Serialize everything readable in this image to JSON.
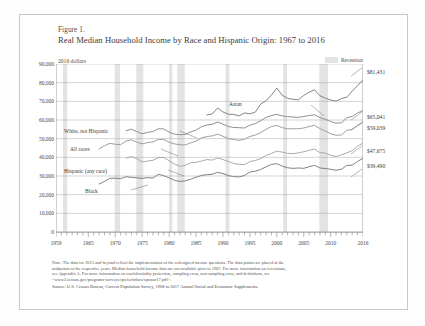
{
  "figure": {
    "label": "Figure 1.",
    "title": "Real Median Household Income by Race and Hispanic Origin: 1967 to 2016",
    "units_label": "2016 dollars"
  },
  "legend": {
    "recession_label": "Recession",
    "recession_color": "#e3e3e3"
  },
  "axes": {
    "y_ticks": [
      "0",
      "10,000",
      "20,000",
      "30,000",
      "40,000",
      "50,000",
      "60,000",
      "70,000",
      "80,000",
      "90,000"
    ],
    "x_ticks": [
      "1959",
      "1965",
      "1970",
      "1975",
      "1980",
      "1985",
      "1990",
      "1995",
      "2000",
      "2005",
      "2010",
      "2016"
    ]
  },
  "series_labels": {
    "asian": "Asian",
    "white_not_hispanic": "White, not Hispanic",
    "all_races": "All races",
    "hispanic": "Hispanic (any race)",
    "black": "Black"
  },
  "end_values": {
    "asian": "$81,431",
    "white_not_hispanic": "$65,041",
    "all_races": "$59,039",
    "hispanic": "$47,675",
    "black": "$39,490"
  },
  "notes": {
    "line1": "Note: The data for 2013 and beyond reflect the implementation of the redesigned income questions. The data points are placed at the",
    "line2": "midpoints of the respective years. Median household income data are not available prior to 1967. For more information on recessions,",
    "line3": "see Appendix A. For more information on confidentiality protection, sampling error, non-sampling error, and definitions, see",
    "line4": "<www2.census.gov/programs-surveys/cps/techdocs/cpsmar17.pdf>.",
    "source": "Source: U.S. Census Bureau, Current Population Survey, 1968 to 2017 Annual Social and Economic Supplements."
  },
  "chart_data": {
    "type": "line",
    "title": "Real Median Household Income by Race and Hispanic Origin: 1967 to 2016",
    "xlabel": "",
    "ylabel": "2016 dollars",
    "xlim": [
      1959,
      2016
    ],
    "ylim": [
      0,
      90000
    ],
    "grid": true,
    "legend_position": "inline-annotations",
    "recession_bands": [
      [
        1960.3,
        1961.1
      ],
      [
        1969.9,
        1970.9
      ],
      [
        1973.9,
        1975.2
      ],
      [
        1980.0,
        1980.6
      ],
      [
        1981.5,
        1982.9
      ],
      [
        1990.5,
        1991.2
      ],
      [
        2001.2,
        2001.9
      ],
      [
        2007.9,
        2009.5
      ]
    ],
    "series": [
      {
        "name": "Asian",
        "color": "#7d7d7d",
        "x": [
          1987,
          1988,
          1989,
          1990,
          1991,
          1992,
          1993,
          1994,
          1995,
          1996,
          1997,
          1998,
          1999,
          2000,
          2001,
          2002,
          2003,
          2004,
          2005,
          2006,
          2007,
          2008,
          2009,
          2010,
          2011,
          2012,
          2013,
          2014,
          2015,
          2016
        ],
        "values": [
          62700,
          63200,
          66500,
          64300,
          63100,
          63000,
          62200,
          63800,
          63300,
          64200,
          68600,
          70300,
          73400,
          77100,
          73300,
          71600,
          71100,
          70800,
          73200,
          74900,
          76200,
          73000,
          71700,
          70700,
          70100,
          71500,
          72200,
          75500,
          78400,
          81431
        ]
      },
      {
        "name": "White, not Hispanic",
        "color": "#8a8a8a",
        "x": [
          1972,
          1973,
          1974,
          1975,
          1976,
          1977,
          1978,
          1979,
          1980,
          1981,
          1982,
          1983,
          1984,
          1985,
          1986,
          1987,
          1988,
          1989,
          1990,
          1991,
          1992,
          1993,
          1994,
          1995,
          1996,
          1997,
          1998,
          1999,
          2000,
          2001,
          2002,
          2003,
          2004,
          2005,
          2006,
          2007,
          2008,
          2009,
          2010,
          2011,
          2012,
          2013,
          2014,
          2015,
          2016
        ],
        "values": [
          54200,
          55100,
          53800,
          52600,
          53400,
          53800,
          55300,
          55200,
          53500,
          52400,
          52100,
          52300,
          53600,
          54600,
          56400,
          57300,
          57700,
          58900,
          57800,
          56500,
          56000,
          55900,
          55700,
          57200,
          58100,
          59600,
          61400,
          62400,
          63000,
          62200,
          61800,
          61600,
          61400,
          61900,
          62400,
          62800,
          61300,
          60400,
          59200,
          58300,
          58500,
          61200,
          61900,
          63800,
          65041
        ]
      },
      {
        "name": "All races",
        "color": "#9a9a9a",
        "x": [
          1967,
          1968,
          1969,
          1970,
          1971,
          1972,
          1973,
          1974,
          1975,
          1976,
          1977,
          1978,
          1979,
          1980,
          1981,
          1982,
          1983,
          1984,
          1985,
          1986,
          1987,
          1988,
          1989,
          1990,
          1991,
          1992,
          1993,
          1994,
          1995,
          1996,
          1997,
          1998,
          1999,
          2000,
          2001,
          2002,
          2003,
          2004,
          2005,
          2006,
          2007,
          2008,
          2009,
          2010,
          2011,
          2012,
          2013,
          2014,
          2015,
          2016
        ],
        "values": [
          44500,
          46200,
          47500,
          47000,
          46800,
          48700,
          49400,
          48200,
          47200,
          47900,
          48200,
          49600,
          49600,
          48100,
          47200,
          46700,
          46700,
          47700,
          48700,
          50400,
          51100,
          51500,
          52400,
          51300,
          50000,
          49600,
          49100,
          49700,
          51200,
          51900,
          53200,
          55000,
          56500,
          57100,
          55900,
          55300,
          55300,
          55300,
          55700,
          56500,
          57100,
          55400,
          54100,
          52600,
          51800,
          52000,
          54500,
          54900,
          57200,
          59039
        ]
      },
      {
        "name": "Hispanic (any race)",
        "color": "#a5a5a5",
        "x": [
          1972,
          1973,
          1974,
          1975,
          1976,
          1977,
          1978,
          1979,
          1980,
          1981,
          1982,
          1983,
          1984,
          1985,
          1986,
          1987,
          1988,
          1989,
          1990,
          1991,
          1992,
          1993,
          1994,
          1995,
          1996,
          1997,
          1998,
          1999,
          2000,
          2001,
          2002,
          2003,
          2004,
          2005,
          2006,
          2007,
          2008,
          2009,
          2010,
          2011,
          2012,
          2013,
          2014,
          2015,
          2016
        ],
        "values": [
          39600,
          40400,
          39300,
          37600,
          38000,
          38400,
          39900,
          39900,
          38200,
          36400,
          35200,
          35700,
          37100,
          37300,
          38000,
          38800,
          38500,
          39700,
          38800,
          37800,
          36700,
          36300,
          36100,
          37700,
          38300,
          39300,
          41000,
          42100,
          43300,
          42800,
          42100,
          42000,
          42400,
          43000,
          43700,
          44500,
          42500,
          42300,
          41100,
          40400,
          41400,
          42400,
          43600,
          46000,
          47675
        ]
      },
      {
        "name": "Black",
        "color": "#7a7a7a",
        "x": [
          1967,
          1968,
          1969,
          1970,
          1971,
          1972,
          1973,
          1974,
          1975,
          1976,
          1977,
          1978,
          1979,
          1980,
          1981,
          1982,
          1983,
          1984,
          1985,
          1986,
          1987,
          1988,
          1989,
          1990,
          1991,
          1992,
          1993,
          1994,
          1995,
          1996,
          1997,
          1998,
          1999,
          2000,
          2001,
          2002,
          2003,
          2004,
          2005,
          2006,
          2007,
          2008,
          2009,
          2010,
          2011,
          2012,
          2013,
          2014,
          2015,
          2016
        ],
        "values": [
          25700,
          27100,
          28800,
          28800,
          28600,
          29600,
          29300,
          29000,
          28700,
          29100,
          28900,
          30900,
          30200,
          29000,
          27700,
          27100,
          27400,
          28300,
          29300,
          30300,
          30700,
          30900,
          32000,
          31300,
          30200,
          29700,
          29500,
          30300,
          32100,
          32600,
          33500,
          34900,
          36200,
          36600,
          35300,
          34400,
          34100,
          34300,
          34100,
          35000,
          35700,
          34300,
          34000,
          33600,
          33100,
          33600,
          35700,
          35800,
          37800,
          39490
        ]
      }
    ]
  }
}
